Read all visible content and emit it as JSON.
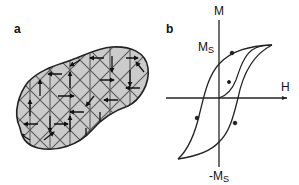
{
  "panel_a": {
    "label": "a",
    "description": "Magnetic domains in a ferromagnetic grain: triangular/diamond lattice of domains each with a magnetization arrow",
    "fill_color": "#c9c9c9",
    "grid_color": "#555555",
    "outline_color": "#222222"
  },
  "panel_b": {
    "label": "b",
    "description": "Magnetic hysteresis loop with initial magnetization curve",
    "y_axis_label": "M",
    "x_axis_label": "H",
    "ms_label": "M",
    "ms_sub": "S",
    "neg_ms_label": "-M",
    "neg_ms_sub": "S",
    "line_color": "#222222"
  }
}
